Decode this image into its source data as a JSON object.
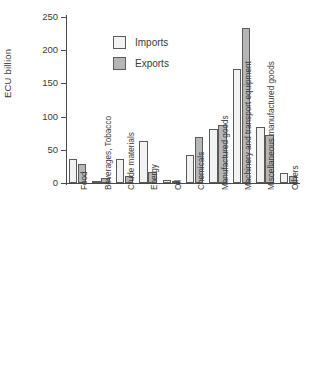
{
  "chart_data": {
    "type": "bar",
    "title": "",
    "xlabel": "",
    "ylabel": "ECU billion",
    "ylim": [
      0,
      250
    ],
    "yticks": [
      0,
      50,
      100,
      150,
      200,
      250
    ],
    "grid": false,
    "legend_position": "upper-left-inside",
    "categories": [
      "Food",
      "Beverages, Tobacco",
      "Crude materials",
      "Energy",
      "Oil",
      "Chemicals",
      "Manufactured goods",
      "Machinery and transport equipment",
      "Miscellaneous manufactured goods",
      "Others"
    ],
    "series": [
      {
        "name": "Imports",
        "color": "#f2f2f2",
        "values": [
          36,
          3,
          36,
          64,
          5,
          42,
          82,
          172,
          85,
          15
        ]
      },
      {
        "name": "Exports",
        "color": "#b6b6b6",
        "values": [
          29,
          8,
          10,
          16,
          3,
          69,
          87,
          233,
          72,
          10
        ]
      }
    ]
  },
  "legend": {
    "items": [
      {
        "label": "Imports"
      },
      {
        "label": "Exports"
      }
    ]
  }
}
